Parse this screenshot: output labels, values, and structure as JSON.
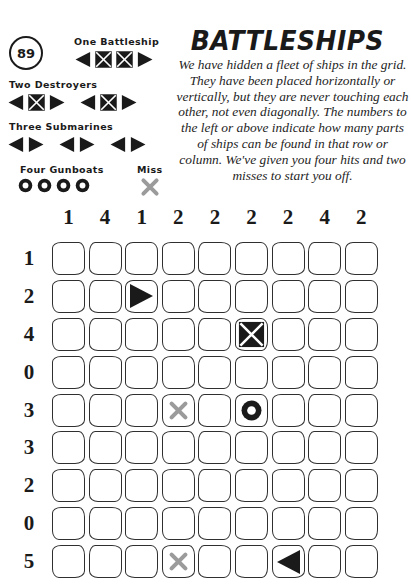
{
  "page": {
    "puzzle_number": "89",
    "title": "BATTLESHIPS",
    "description": "We have hidden a fleet of ships in the grid. They have been placed horizontally or vertically, but they are never touching each other, not even diagonally. The numbers to the left or above indicate how many parts of ships can be found in that row or column. We've given you four hits and two misses to start you off."
  },
  "legend": {
    "groups": [
      {
        "label": "One Battleship",
        "icons": [
          "end-left",
          "middle",
          "middle",
          "end-right"
        ]
      },
      {
        "label": "Two Destroyers",
        "icons": [
          "end-left",
          "middle",
          "end-right",
          "gap",
          "end-left",
          "middle",
          "end-right"
        ]
      },
      {
        "label": "Three Submarines",
        "icons": [
          "end-left",
          "end-right",
          "gap",
          "end-left",
          "end-right",
          "gap",
          "end-left",
          "end-right"
        ]
      },
      {
        "label": "Four Gunboats",
        "icons": [
          "gunboat",
          "gunboat",
          "gunboat",
          "gunboat"
        ]
      }
    ],
    "miss_label": "Miss",
    "miss_icon": "miss"
  },
  "grid": {
    "rows": 9,
    "cols": 9,
    "col_clues": [
      1,
      4,
      1,
      2,
      2,
      2,
      2,
      4,
      2
    ],
    "row_clues": [
      1,
      2,
      4,
      0,
      3,
      3,
      2,
      0,
      5
    ],
    "marks": [
      {
        "row": 1,
        "col": 2,
        "type": "end-right"
      },
      {
        "row": 2,
        "col": 5,
        "type": "middle"
      },
      {
        "row": 4,
        "col": 3,
        "type": "miss"
      },
      {
        "row": 4,
        "col": 5,
        "type": "gunboat"
      },
      {
        "row": 8,
        "col": 3,
        "type": "miss"
      },
      {
        "row": 8,
        "col": 6,
        "type": "end-left"
      }
    ]
  },
  "colors": {
    "ink": "#1a1a1a",
    "miss": "#9b9b9b",
    "cell_border": "#2f2f2f"
  }
}
